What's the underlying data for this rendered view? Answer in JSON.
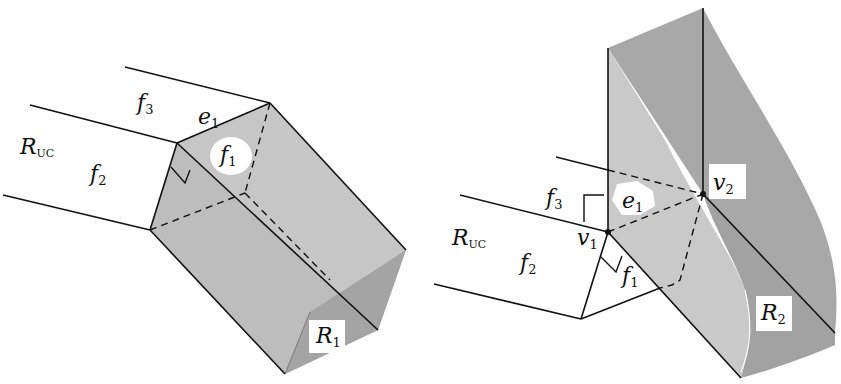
{
  "figures": [
    {
      "id": "left",
      "description": "Region R1 extruded from face f1 of unbounded region",
      "labels": {
        "region_uc": {
          "main": "R",
          "sub": "UC"
        },
        "face_f3": {
          "main": "f",
          "sub": "3"
        },
        "face_f2": {
          "main": "f",
          "sub": "2"
        },
        "face_f1": {
          "main": "f",
          "sub": "1"
        },
        "edge_e1": {
          "main": "e",
          "sub": "1"
        },
        "region_r1": {
          "main": "R",
          "sub": "1"
        }
      }
    },
    {
      "id": "right",
      "description": "Region R2 swept along edge e1 between vertices v1 and v2",
      "labels": {
        "region_uc": {
          "main": "R",
          "sub": "UC"
        },
        "face_f3": {
          "main": "f",
          "sub": "3"
        },
        "face_f2": {
          "main": "f",
          "sub": "2"
        },
        "face_f1": {
          "main": "f",
          "sub": "1"
        },
        "edge_e1": {
          "main": "e",
          "sub": "1"
        },
        "vertex_v1": {
          "main": "v",
          "sub": "1"
        },
        "vertex_v2": {
          "main": "v",
          "sub": "2"
        },
        "region_r2": {
          "main": "R",
          "sub": "2"
        }
      }
    }
  ],
  "colors": {
    "light_gray": "#c9c9c9",
    "mid_gray": "#b4b4b4",
    "dark_gray": "#9d9d9d",
    "line": "#111111"
  }
}
